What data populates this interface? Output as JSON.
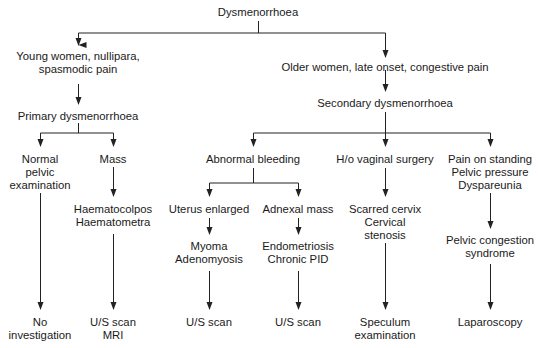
{
  "diagram": {
    "type": "flowchart",
    "nodes": {
      "root": [
        "Dysmenorrhoea"
      ],
      "young": [
        "Young women, nullipara,",
        "spasmodic pain"
      ],
      "primary": [
        "Primary dysmenorrhoea"
      ],
      "normal": [
        "Normal",
        "pelvic",
        "examination"
      ],
      "mass": [
        "Mass"
      ],
      "haemato": [
        "Haematocolpos",
        "Haematometra"
      ],
      "no_inv": [
        "No",
        "investigation"
      ],
      "us_mri": [
        "U/S scan",
        "MRI"
      ],
      "older": [
        "Older women, late onset, congestive pain"
      ],
      "secondary": [
        "Secondary dysmenorrhoea"
      ],
      "abnormal": [
        "Abnormal bleeding"
      ],
      "uterus": [
        "Uterus enlarged"
      ],
      "adnexal": [
        "Adnexal mass"
      ],
      "myoma": [
        "Myoma",
        "Adenomyosis"
      ],
      "endo": [
        "Endometriosis",
        "Chronic PID"
      ],
      "us1": [
        "U/S scan"
      ],
      "us2": [
        "U/S scan"
      ],
      "hvs": [
        "H/o vaginal surgery"
      ],
      "scarred": [
        "Scarred cervix",
        "Cervical",
        "stenosis"
      ],
      "speculum": [
        "Speculum",
        "examination"
      ],
      "pain": [
        "Pain on standing",
        "Pelvic pressure",
        "Dyspareunia"
      ],
      "pcs": [
        "Pelvic congestion",
        "syndrome"
      ],
      "lap": [
        "Laparoscopy"
      ]
    },
    "edges": [
      [
        "root",
        "young"
      ],
      [
        "root",
        "older"
      ],
      [
        "young",
        "primary"
      ],
      [
        "primary",
        "normal"
      ],
      [
        "primary",
        "mass"
      ],
      [
        "mass",
        "haemato"
      ],
      [
        "haemato",
        "us_mri"
      ],
      [
        "normal",
        "no_inv"
      ],
      [
        "older",
        "secondary"
      ],
      [
        "secondary",
        "abnormal"
      ],
      [
        "secondary",
        "hvs"
      ],
      [
        "secondary",
        "pain"
      ],
      [
        "abnormal",
        "uterus"
      ],
      [
        "abnormal",
        "adnexal"
      ],
      [
        "uterus",
        "myoma"
      ],
      [
        "myoma",
        "us1"
      ],
      [
        "adnexal",
        "endo"
      ],
      [
        "endo",
        "us2"
      ],
      [
        "hvs",
        "scarred"
      ],
      [
        "scarred",
        "speculum"
      ],
      [
        "pain",
        "pcs"
      ],
      [
        "pcs",
        "lap"
      ]
    ],
    "line_color": "#222222"
  }
}
